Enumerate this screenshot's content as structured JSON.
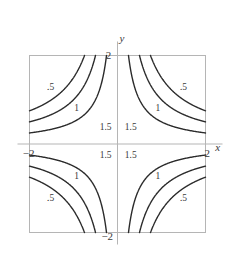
{
  "chart_data": {
    "type": "line",
    "title": "",
    "xlabel": "x",
    "ylabel": "y",
    "xlim": [
      -2,
      2
    ],
    "ylim": [
      -2,
      2
    ],
    "grid": false,
    "legend": null,
    "levels": [
      0.5,
      1,
      1.5
    ],
    "level_labels": [
      ".5",
      "1",
      "1.5"
    ],
    "x_ticks": [
      -2,
      2
    ],
    "x_tick_labels": [
      "−2",
      "2"
    ],
    "y_ticks": [
      -2,
      2
    ],
    "y_tick_labels": [
      "2",
      "−2"
    ],
    "colors": {
      "contour": "#2b2b2b",
      "frame": "#b5b5b5",
      "axis": "#b5b5b5",
      "text": "#3a3a3a",
      "background": "#ffffff"
    },
    "contour_label_positions": [
      {
        "level": ".5",
        "quadrant": "upper-left",
        "x": -1.52,
        "y": 1.22
      },
      {
        "level": "1",
        "quadrant": "upper-left",
        "x": -0.93,
        "y": 0.74
      },
      {
        "level": "1.5",
        "quadrant": "upper-left",
        "x": -0.27,
        "y": 0.31
      },
      {
        "level": ".5",
        "quadrant": "upper-right",
        "x": 1.5,
        "y": 1.22
      },
      {
        "level": "1",
        "quadrant": "upper-right",
        "x": 0.92,
        "y": 0.74
      },
      {
        "level": "1.5",
        "quadrant": "upper-right",
        "x": 0.3,
        "y": 0.31
      },
      {
        "level": "1.5",
        "quadrant": "lower-left",
        "x": -0.27,
        "y": -0.32
      },
      {
        "level": "1",
        "quadrant": "lower-left",
        "x": -0.93,
        "y": -0.78
      },
      {
        "level": ".5",
        "quadrant": "lower-left",
        "x": -1.52,
        "y": -1.28
      },
      {
        "level": "1.5",
        "quadrant": "lower-right",
        "x": 0.3,
        "y": -0.32
      },
      {
        "level": "1",
        "quadrant": "lower-right",
        "x": 0.92,
        "y": -0.78
      },
      {
        "level": ".5",
        "quadrant": "lower-right",
        "x": 1.5,
        "y": -1.28
      }
    ],
    "axis_label_positions": {
      "x": {
        "x": 2.28,
        "y": -0.16
      },
      "y": {
        "x": 0.1,
        "y": 2.3
      }
    },
    "tick_label_positions": [
      {
        "label": "−2",
        "x": -2.02,
        "y": -0.3,
        "anchor": "middle"
      },
      {
        "label": "2",
        "x": 2.04,
        "y": -0.3,
        "anchor": "middle"
      },
      {
        "label": "2",
        "x": -0.14,
        "y": 1.92,
        "anchor": "end"
      },
      {
        "label": "−2",
        "x": -0.1,
        "y": -2.16,
        "anchor": "end"
      }
    ]
  }
}
